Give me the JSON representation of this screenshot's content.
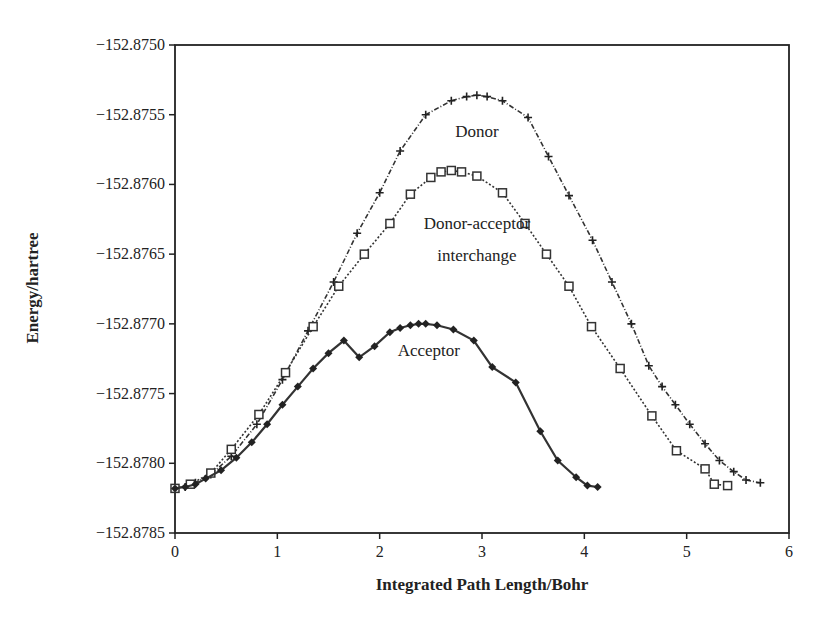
{
  "chart_data": {
    "type": "line",
    "title": "",
    "xlabel": "Integrated Path Length/Bohr",
    "ylabel": "Energy/hartree",
    "xlim": [
      0,
      6
    ],
    "ylim": [
      -152.8785,
      -152.875
    ],
    "x_ticks": [
      "0",
      "1",
      "2",
      "3",
      "4",
      "5",
      "6"
    ],
    "y_ticks": [
      "-152.8750",
      "-152.8755",
      "-152.8760",
      "-152.8765",
      "-152.8770",
      "-152.8775",
      "-152.8780",
      "-152.8785"
    ],
    "grid": false,
    "legend": "none (curves labeled inline)",
    "annotations": [
      {
        "text": "Donor",
        "x": 2.95,
        "y": -152.87566
      },
      {
        "text": "Donor-acceptor",
        "x": 2.95,
        "y": -152.87632
      },
      {
        "text": "interchange",
        "x": 2.95,
        "y": -152.87655
      },
      {
        "text": "Acceptor",
        "x": 2.48,
        "y": -152.87723
      }
    ],
    "series": [
      {
        "name": "Donor",
        "marker": "cross",
        "line": "dash-dot",
        "x": [
          0.0,
          0.1,
          0.2,
          0.35,
          0.55,
          0.8,
          1.05,
          1.3,
          1.55,
          1.78,
          2.0,
          2.2,
          2.45,
          2.7,
          2.85,
          2.95,
          3.05,
          3.2,
          3.45,
          3.65,
          3.85,
          4.08,
          4.27,
          4.46,
          4.63,
          4.76,
          4.89,
          5.03,
          5.18,
          5.32,
          5.46,
          5.58,
          5.72
        ],
        "y": [
          -152.87818,
          -152.87817,
          -152.87814,
          -152.87808,
          -152.87795,
          -152.87772,
          -152.8774,
          -152.87705,
          -152.8767,
          -152.87635,
          -152.87606,
          -152.87576,
          -152.8755,
          -152.8754,
          -152.87537,
          -152.87536,
          -152.87537,
          -152.8754,
          -152.87552,
          -152.8758,
          -152.87608,
          -152.8764,
          -152.8767,
          -152.877,
          -152.8773,
          -152.87745,
          -152.87758,
          -152.87772,
          -152.87786,
          -152.87798,
          -152.87806,
          -152.87812,
          -152.87814
        ]
      },
      {
        "name": "Donor-acceptor interchange",
        "marker": "square",
        "line": "dotted",
        "x": [
          0.0,
          0.15,
          0.35,
          0.55,
          0.82,
          1.08,
          1.35,
          1.6,
          1.85,
          2.1,
          2.3,
          2.5,
          2.6,
          2.7,
          2.8,
          2.95,
          3.2,
          3.42,
          3.63,
          3.85,
          4.07,
          4.35,
          4.66,
          4.9,
          5.18,
          5.27,
          5.4
        ],
        "y": [
          -152.87818,
          -152.87815,
          -152.87807,
          -152.8779,
          -152.87765,
          -152.87735,
          -152.87702,
          -152.87673,
          -152.8765,
          -152.87628,
          -152.87607,
          -152.87595,
          -152.87591,
          -152.8759,
          -152.87591,
          -152.87594,
          -152.87606,
          -152.87628,
          -152.8765,
          -152.87673,
          -152.87702,
          -152.87732,
          -152.87766,
          -152.87791,
          -152.87804,
          -152.87815,
          -152.87816
        ]
      },
      {
        "name": "Acceptor",
        "marker": "diamond",
        "line": "solid",
        "x": [
          0.0,
          0.1,
          0.2,
          0.3,
          0.45,
          0.6,
          0.75,
          0.9,
          1.05,
          1.2,
          1.35,
          1.5,
          1.65,
          1.8,
          1.95,
          2.1,
          2.2,
          2.3,
          2.38,
          2.45,
          2.56,
          2.72,
          2.92,
          3.1,
          3.33,
          3.57,
          3.74,
          3.92,
          4.03,
          4.13
        ],
        "y": [
          -152.87818,
          -152.87817,
          -152.87815,
          -152.87811,
          -152.87805,
          -152.87796,
          -152.87785,
          -152.87772,
          -152.87758,
          -152.87745,
          -152.87732,
          -152.87721,
          -152.87712,
          -152.87724,
          -152.87716,
          -152.87706,
          -152.87703,
          -152.87701,
          -152.877,
          -152.877,
          -152.87701,
          -152.87704,
          -152.87712,
          -152.87731,
          -152.87742,
          -152.87777,
          -152.87798,
          -152.8781,
          -152.87816,
          -152.87817
        ]
      }
    ]
  }
}
